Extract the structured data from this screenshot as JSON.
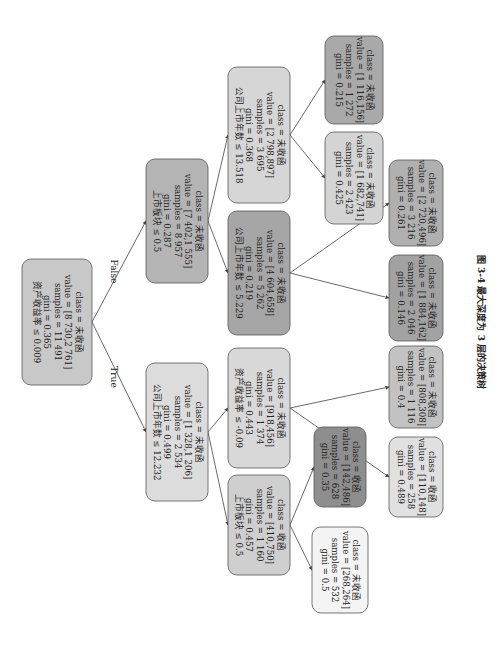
{
  "figure": {
    "caption": "图 3-4   最大深度为 3 层的决策树",
    "edge_labels": {
      "true": "True",
      "false": "False"
    }
  },
  "nodes": [
    {
      "id": "root",
      "depth": 0,
      "condition": "资产收益率 ≤ 0.009",
      "gini": "gini = 0.365",
      "samples": "samples = 11 491",
      "value": "value = [8 730,2 761]",
      "class": "class = 未收函",
      "fill": "#c8c8c8",
      "cx": 57,
      "cy": 322,
      "w": 70,
      "h": 126
    },
    {
      "id": "n1_false",
      "depth": 1,
      "condition": "上市板块 ≤ 0.5",
      "gini": "gini = 0.287",
      "samples": "samples = 8 957",
      "value": "value = [7 402,1 555]",
      "class": "class = 未收函",
      "fill": "#b4b4b4",
      "cx": 177,
      "cy": 221,
      "w": 62,
      "h": 124
    },
    {
      "id": "n1_true",
      "depth": 1,
      "condition": "公司上市年数 ≤ 12.232",
      "gini": "gini = 0.499",
      "samples": "samples = 2 534",
      "value": "value = [1 328,1 206]",
      "class": "class = 未收函",
      "fill": "#dcdcdc",
      "cx": 177,
      "cy": 432,
      "w": 62,
      "h": 138
    },
    {
      "id": "n2_a",
      "depth": 2,
      "condition": "公司上市年数 ≤ 13.518",
      "gini": "gini = 0.368",
      "samples": "samples = 3 695",
      "value": "value = [2 798,897]",
      "class": "class = 未收函",
      "fill": "#d6d6d6",
      "cx": 259,
      "cy": 135,
      "w": 62,
      "h": 136
    },
    {
      "id": "n2_b",
      "depth": 2,
      "condition": "公司上市年数 ≤ 5.229",
      "gini": "gini = 0.219",
      "samples": "samples = 5 262",
      "value": "value = [4 604,658]",
      "class": "class = 未收函",
      "fill": "#a6a6a6",
      "cx": 259,
      "cy": 273,
      "w": 62,
      "h": 124
    },
    {
      "id": "n2_c",
      "depth": 2,
      "condition": "资产收益率 ≤ -0.09",
      "gini": "gini = 0.443",
      "samples": "samples = 1 374",
      "value": "value = [918,456]",
      "class": "class = 未收函",
      "fill": "#d8d8d8",
      "cx": 259,
      "cy": 408,
      "w": 62,
      "h": 120
    },
    {
      "id": "n2_d",
      "depth": 2,
      "condition": "上市板块 ≤ 0.5",
      "gini": "gini = 0.457",
      "samples": "samples = 1 160",
      "value": "value = [410,750]",
      "class": "class = 收函",
      "fill": "#cfcfcf",
      "cx": 259,
      "cy": 525,
      "w": 62,
      "h": 100
    },
    {
      "id": "leaf_1",
      "depth": 3,
      "gini": "gini = 0.215",
      "samples": "samples = 1 272",
      "value": "value = [1 116,156]",
      "class": "class = 未收函",
      "fill": "#a9a9a9",
      "cx": 354,
      "cy": 80,
      "w": 58,
      "h": 88
    },
    {
      "id": "leaf_2",
      "depth": 3,
      "gini": "gini = 0.425",
      "samples": "samples = 2 423",
      "value": "value = [1 682,741]",
      "class": "class = 未收函",
      "fill": "#d4d4d4",
      "cx": 354,
      "cy": 178,
      "w": 58,
      "h": 92
    },
    {
      "id": "leaf_3",
      "depth": 3,
      "gini": "gini = 0.261",
      "samples": "samples = 3 216",
      "value": "value = [2 720,496]",
      "class": "class = 未收函",
      "fill": "#b0b0b0",
      "cx": 416,
      "cy": 203,
      "w": 54,
      "h": 86
    },
    {
      "id": "leaf_4",
      "depth": 3,
      "gini": "gini = 0.146",
      "samples": "samples = 2 046",
      "value": "value = [1 884,162]",
      "class": "class = 未收函",
      "fill": "#a2a2a2",
      "cx": 416,
      "cy": 298,
      "w": 54,
      "h": 86
    },
    {
      "id": "leaf_5",
      "depth": 3,
      "gini": "gini = 0.4",
      "samples": "samples = 1 116",
      "value": "value = [808,308]",
      "class": "class = 未收函",
      "fill": "#c2c2c2",
      "cx": 416,
      "cy": 387,
      "w": 54,
      "h": 82
    },
    {
      "id": "leaf_6",
      "depth": 3,
      "gini": "gini = 0.489",
      "samples": "samples = 258",
      "value": "value = [110,148]",
      "class": "class = 收函",
      "fill": "#e0e0e0",
      "cx": 416,
      "cy": 477,
      "w": 54,
      "h": 80
    },
    {
      "id": "leaf_7",
      "depth": 3,
      "gini": "gini = 0.35",
      "samples": "samples = 628",
      "value": "value = [142,486]",
      "class": "class = 收函",
      "fill": "#8e8e8e",
      "cx": 340,
      "cy": 467,
      "w": 52,
      "h": 80
    },
    {
      "id": "leaf_8",
      "depth": 3,
      "gini": "gini = 0.5",
      "samples": "samples = 532",
      "value": "value = [268,264]",
      "class": "class = 未收函",
      "fill": "#f4f4f4",
      "cx": 340,
      "cy": 570,
      "w": 56,
      "h": 86
    }
  ],
  "edges": [
    {
      "from": "root",
      "to": "n1_false",
      "label": "False"
    },
    {
      "from": "root",
      "to": "n1_true",
      "label": "True"
    },
    {
      "from": "n1_false",
      "to": "n2_a"
    },
    {
      "from": "n1_false",
      "to": "n2_b"
    },
    {
      "from": "n1_true",
      "to": "n2_c"
    },
    {
      "from": "n1_true",
      "to": "n2_d"
    },
    {
      "from": "n2_a",
      "to": "leaf_1"
    },
    {
      "from": "n2_a",
      "to": "leaf_2"
    },
    {
      "from": "n2_b",
      "to": "leaf_3"
    },
    {
      "from": "n2_b",
      "to": "leaf_4"
    },
    {
      "from": "n2_c",
      "to": "leaf_5"
    },
    {
      "from": "n2_c",
      "to": "leaf_6"
    },
    {
      "from": "n2_d",
      "to": "leaf_7"
    },
    {
      "from": "n2_d",
      "to": "leaf_8"
    }
  ]
}
